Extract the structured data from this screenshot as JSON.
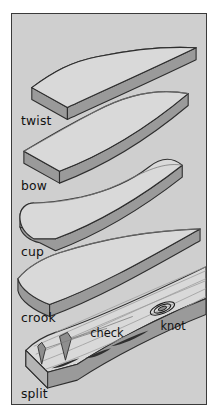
{
  "figure": {
    "background_color": "#cfcfcf",
    "border_color": "#3a3a3a",
    "board_top_color": "#d9d9d9",
    "board_side_color": "#9a9a9a",
    "label_color": "#111111"
  },
  "labels": {
    "twist": "twist",
    "bow": "bow",
    "cup": "cup",
    "crook": "crook",
    "split": "split",
    "check": "check",
    "knot": "knot"
  },
  "boards": [
    {
      "name": "twist",
      "label": "twist",
      "defect": "twist",
      "order": 1
    },
    {
      "name": "bow",
      "label": "bow",
      "defect": "bow",
      "order": 2
    },
    {
      "name": "cup",
      "label": "cup",
      "defect": "cup",
      "order": 3
    },
    {
      "name": "crook",
      "label": "crook",
      "defect": "crook",
      "order": 4
    },
    {
      "name": "split",
      "label": "split",
      "defect": "split",
      "order": 5
    }
  ],
  "callouts": [
    {
      "name": "check",
      "label": "check"
    },
    {
      "name": "knot",
      "label": "knot"
    }
  ]
}
